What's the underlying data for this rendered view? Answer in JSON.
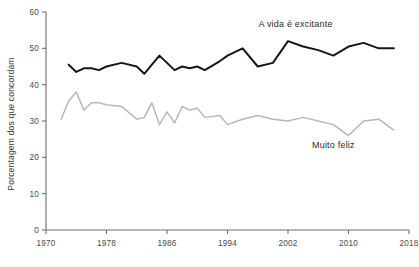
{
  "chart_data": {
    "type": "line",
    "title": "",
    "subtitle": "",
    "xlabel": "",
    "ylabel": "Porcentagem dos que concordam",
    "xlim": [
      1970,
      2018
    ],
    "ylim": [
      0,
      60
    ],
    "xticks": [
      "1970",
      "1978",
      "1986",
      "1994",
      "2002",
      "2010",
      "2018"
    ],
    "xtick_values": [
      1970,
      1978,
      1986,
      1994,
      2002,
      2010,
      2018
    ],
    "yticks": [
      "0",
      "10",
      "20",
      "30",
      "40",
      "50",
      "60"
    ],
    "ytick_values": [
      0,
      10,
      20,
      30,
      40,
      50,
      60
    ],
    "grid": false,
    "legend_position": "inline-annotation",
    "series": [
      {
        "name": "A vida é excitante",
        "color": "#17161a",
        "annotation_label": "A vida é excitante",
        "annotation_x": 2003,
        "annotation_y": 56,
        "x": [
          1973,
          1974,
          1975,
          1976,
          1977,
          1978,
          1980,
          1982,
          1983,
          1984,
          1985,
          1986,
          1987,
          1988,
          1989,
          1990,
          1991,
          1993,
          1994,
          1996,
          1998,
          2000,
          2002,
          2004,
          2006,
          2008,
          2010,
          2012,
          2014,
          2016
        ],
        "values": [
          45.5,
          43.5,
          44.5,
          44.5,
          44.0,
          45.0,
          46.0,
          45.0,
          43.0,
          45.5,
          48.0,
          46.0,
          44.0,
          45.0,
          44.5,
          45.0,
          44.0,
          46.5,
          48.0,
          50.0,
          45.0,
          46.0,
          52.0,
          50.5,
          49.5,
          48.0,
          50.5,
          51.5,
          50.0,
          50.0
        ]
      },
      {
        "name": "Muito feliz",
        "color": "#b9b7b0",
        "annotation_label": "Muito feliz",
        "annotation_x": 2008,
        "annotation_y": 22.5,
        "x": [
          1972,
          1973,
          1974,
          1975,
          1976,
          1977,
          1978,
          1980,
          1982,
          1983,
          1984,
          1985,
          1986,
          1987,
          1988,
          1989,
          1990,
          1991,
          1993,
          1994,
          1996,
          1998,
          2000,
          2002,
          2004,
          2006,
          2008,
          2010,
          2012,
          2014,
          2016
        ],
        "values": [
          30.5,
          35.5,
          38.0,
          33.0,
          35.0,
          35.0,
          34.5,
          34.0,
          30.5,
          31.0,
          35.0,
          29.0,
          32.5,
          29.5,
          34.0,
          33.0,
          33.5,
          31.0,
          31.5,
          29.0,
          30.5,
          31.5,
          30.5,
          30.0,
          31.0,
          30.0,
          29.0,
          26.0,
          30.0,
          30.5,
          27.5
        ]
      }
    ]
  }
}
